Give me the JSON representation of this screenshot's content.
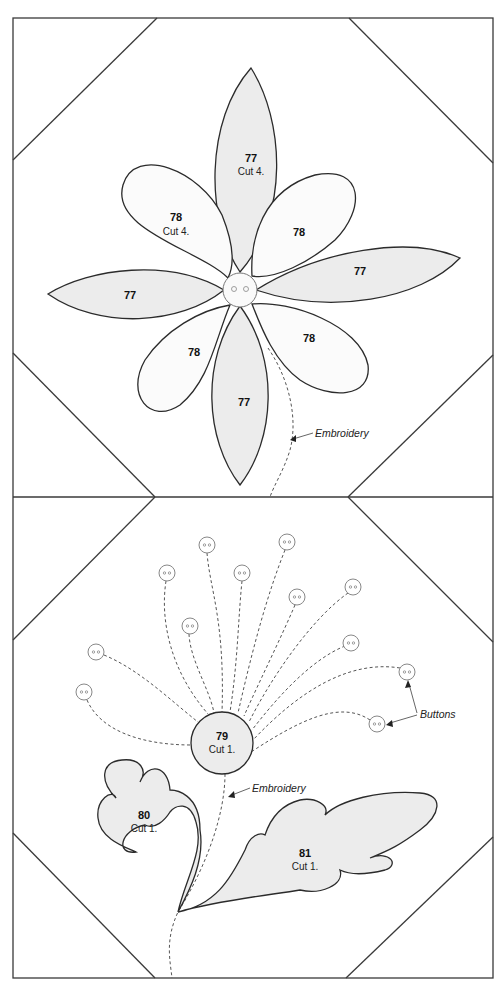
{
  "diagram": {
    "type": "quilt block applique pattern",
    "colors": {
      "outline": "#3a3a3a",
      "shaded_piece": "#ececec",
      "light_piece": "#fbfbfb",
      "stitch": "#555555",
      "background": "#ffffff"
    },
    "top_block": {
      "pieces": [
        {
          "id": "petal-77-top",
          "number": "77",
          "cut": "Cut 4."
        },
        {
          "id": "petal-78-upper-left",
          "number": "78",
          "cut": "Cut 4."
        },
        {
          "id": "petal-78-upper-right",
          "number": "78",
          "cut": ""
        },
        {
          "id": "petal-77-right",
          "number": "77",
          "cut": ""
        },
        {
          "id": "petal-77-left",
          "number": "77",
          "cut": ""
        },
        {
          "id": "petal-78-lower-left",
          "number": "78",
          "cut": ""
        },
        {
          "id": "petal-78-lower-right",
          "number": "78",
          "cut": ""
        },
        {
          "id": "petal-77-bottom",
          "number": "77",
          "cut": ""
        }
      ],
      "center": "button",
      "callouts": [
        {
          "label": "Embroidery"
        }
      ]
    },
    "bottom_block": {
      "pieces": [
        {
          "id": "flower-center-79",
          "number": "79",
          "cut": "Cut 1."
        },
        {
          "id": "leaf-80",
          "number": "80",
          "cut": "Cut 1."
        },
        {
          "id": "leaf-81",
          "number": "81",
          "cut": "Cut 1."
        }
      ],
      "button_count": 13,
      "callouts": [
        {
          "label": "Embroidery"
        },
        {
          "label": "Buttons"
        }
      ]
    }
  }
}
